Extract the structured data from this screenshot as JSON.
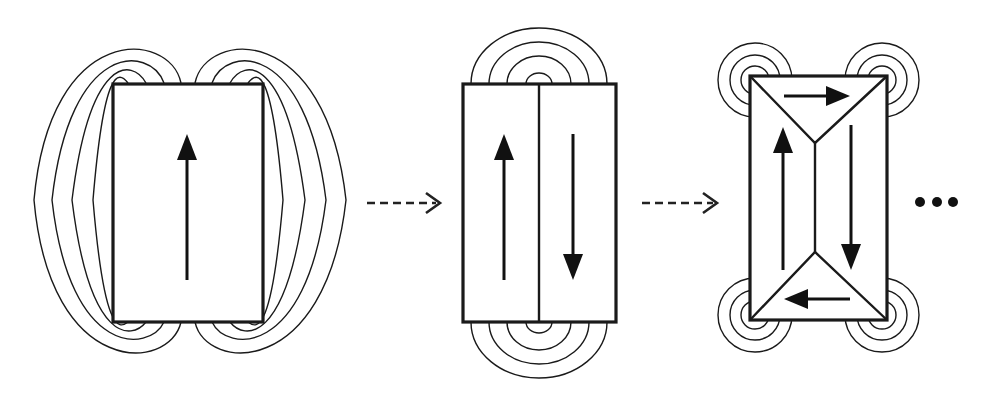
{
  "diagram": {
    "stages": [
      {
        "id": "single-domain",
        "domains": 1,
        "magnetization": [
          "up"
        ],
        "stray_field": "large loops on both sides"
      },
      {
        "id": "two-domain",
        "domains": 2,
        "magnetization": [
          "up",
          "down"
        ],
        "stray_field": "smaller loops at top and bottom"
      },
      {
        "id": "closure-domain",
        "domains": 4,
        "magnetization": [
          "right",
          "down",
          "left",
          "up"
        ],
        "stray_field": "tiny loops only at corners"
      }
    ],
    "transitions": [
      "dashed-arrow",
      "dashed-arrow"
    ],
    "continuation": "...",
    "colors": {
      "line": "#1a1a1a",
      "background": "#ffffff"
    }
  }
}
